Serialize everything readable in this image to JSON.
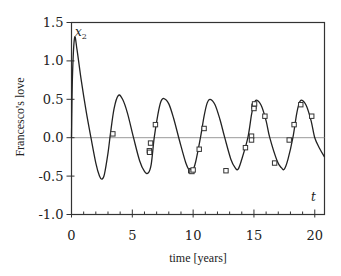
{
  "chart_data": {
    "type": "line",
    "title": "",
    "xlabel": "time [years]",
    "ylabel": "Francesco's love",
    "xlim": [
      0,
      20.8
    ],
    "ylim": [
      -1.0,
      1.5
    ],
    "x_ticks": [
      0,
      5,
      10,
      15,
      20
    ],
    "x_tick_labels": [
      "0",
      "5",
      "10",
      "15",
      "20"
    ],
    "x_minor_step": 1,
    "y_ticks": [
      -1.0,
      -0.5,
      0.0,
      0.5,
      1.0,
      1.5
    ],
    "y_tick_labels": [
      "-1.0",
      "-0.5",
      "0.0",
      "0.5",
      "1.0",
      "1.5"
    ],
    "grid": false,
    "zero_line": true,
    "legend": null,
    "annotations": {
      "variable": "x",
      "variable_subscript": "2",
      "time_symbol": "t"
    },
    "series": [
      {
        "name": "model x2(t)",
        "style": "line",
        "color": "#222222",
        "points": [
          [
            0,
            0.0
          ],
          [
            0.08,
            0.8
          ],
          [
            0.25,
            1.3
          ],
          [
            0.45,
            1.15
          ],
          [
            0.8,
            0.75
          ],
          [
            1.2,
            0.35
          ],
          [
            1.6,
            0.0
          ],
          [
            2.0,
            -0.33
          ],
          [
            2.3,
            -0.5
          ],
          [
            2.5,
            -0.54
          ],
          [
            2.7,
            -0.48
          ],
          [
            3.0,
            -0.2
          ],
          [
            3.2,
            0.05
          ],
          [
            3.5,
            0.38
          ],
          [
            3.85,
            0.55
          ],
          [
            4.2,
            0.5
          ],
          [
            4.6,
            0.32
          ],
          [
            5.1,
            0.0
          ],
          [
            5.6,
            -0.3
          ],
          [
            6.0,
            -0.44
          ],
          [
            6.3,
            -0.46
          ],
          [
            6.55,
            -0.35
          ],
          [
            6.8,
            0.0
          ],
          [
            7.1,
            0.3
          ],
          [
            7.35,
            0.47
          ],
          [
            7.6,
            0.51
          ],
          [
            8.0,
            0.44
          ],
          [
            8.4,
            0.25
          ],
          [
            8.9,
            -0.05
          ],
          [
            9.4,
            -0.33
          ],
          [
            9.7,
            -0.43
          ],
          [
            9.9,
            -0.45
          ],
          [
            10.2,
            -0.32
          ],
          [
            10.6,
            0.0
          ],
          [
            10.9,
            0.28
          ],
          [
            11.15,
            0.45
          ],
          [
            11.4,
            0.5
          ],
          [
            11.8,
            0.43
          ],
          [
            12.2,
            0.24
          ],
          [
            12.6,
            0.0
          ],
          [
            13.1,
            -0.28
          ],
          [
            13.45,
            -0.39
          ],
          [
            13.7,
            -0.41
          ],
          [
            14.0,
            -0.28
          ],
          [
            14.5,
            0.0
          ],
          [
            14.8,
            0.3
          ],
          [
            15.0,
            0.44
          ],
          [
            15.2,
            0.49
          ],
          [
            15.6,
            0.42
          ],
          [
            16.0,
            0.22
          ],
          [
            16.3,
            0.0
          ],
          [
            16.9,
            -0.3
          ],
          [
            17.25,
            -0.39
          ],
          [
            17.5,
            -0.41
          ],
          [
            17.8,
            -0.28
          ],
          [
            18.2,
            0.0
          ],
          [
            18.5,
            0.3
          ],
          [
            18.7,
            0.44
          ],
          [
            18.9,
            0.49
          ],
          [
            19.3,
            0.42
          ],
          [
            19.7,
            0.22
          ],
          [
            20.0,
            0.0
          ],
          [
            20.4,
            -0.14
          ],
          [
            20.8,
            -0.25
          ]
        ]
      },
      {
        "name": "observations",
        "style": "open-square",
        "color": "#333333",
        "points": [
          [
            3.4,
            0.05
          ],
          [
            6.5,
            -0.07
          ],
          [
            6.4,
            -0.17
          ],
          [
            6.42,
            -0.19
          ],
          [
            6.9,
            0.17
          ],
          [
            9.8,
            -0.43
          ],
          [
            9.9,
            -0.44
          ],
          [
            10.0,
            -0.42
          ],
          [
            10.5,
            -0.15
          ],
          [
            10.9,
            0.12
          ],
          [
            12.7,
            -0.43
          ],
          [
            14.3,
            -0.13
          ],
          [
            14.8,
            0.02
          ],
          [
            14.8,
            -0.03
          ],
          [
            15.0,
            0.41
          ],
          [
            15.05,
            0.44
          ],
          [
            15.0,
            0.38
          ],
          [
            15.9,
            0.28
          ],
          [
            16.7,
            -0.33
          ],
          [
            17.9,
            -0.03
          ],
          [
            18.3,
            0.17
          ],
          [
            18.85,
            0.43
          ],
          [
            19.75,
            0.28
          ]
        ]
      }
    ]
  }
}
